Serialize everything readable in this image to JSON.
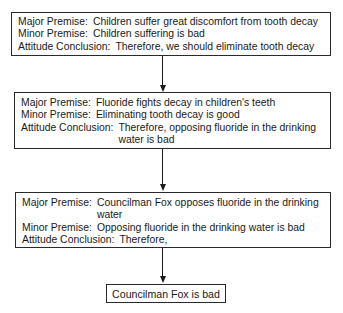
{
  "boxes": [
    {
      "rows": [
        {
          "label": "Major Premise:",
          "text": "Children suffer great discomfort from tooth decay"
        },
        {
          "label": "Minor Premise:",
          "text": "Children suffering is bad"
        },
        {
          "label": "Attitude Conclusion:",
          "text": "Therefore, we should eliminate tooth decay"
        }
      ]
    },
    {
      "rows": [
        {
          "label": "Major Premise:",
          "text": "Fluoride fights decay in children's teeth"
        },
        {
          "label": "Minor Premise:",
          "text": "Eliminating tooth decay is good"
        },
        {
          "label": "Attitude Conclusion:",
          "text": "Therefore, opposing fluoride in the drinking water is bad"
        }
      ]
    },
    {
      "rows": [
        {
          "label": "Major Premise:",
          "text": "Councilman Fox opposes fluoride in the drinking water"
        },
        {
          "label": "Minor Premise:",
          "text": "Opposing fluoride in the drinking water is bad"
        },
        {
          "label": "Attitude Conclusion:",
          "text": "Therefore,"
        }
      ]
    }
  ],
  "final": {
    "text": "Councilman Fox is bad"
  },
  "colors": {
    "stroke": "#2a2a2a",
    "background": "#ffffff"
  }
}
